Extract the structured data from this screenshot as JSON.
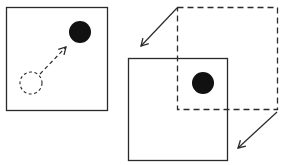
{
  "diagram": {
    "colors": {
      "stroke": "#2a2a2a",
      "fill": "#111111",
      "background": "#ffffff"
    },
    "left_panel": {
      "frame": {
        "x": 6,
        "y": 7,
        "w": 101,
        "h": 103
      },
      "start_circle": {
        "cx": 31,
        "cy": 83,
        "r": 11,
        "style": "dashed"
      },
      "end_dot": {
        "cx": 80,
        "cy": 32,
        "r": 11,
        "style": "filled"
      },
      "arrow": {
        "x1": 40,
        "y1": 74,
        "x2": 66,
        "y2": 47,
        "style": "dashed"
      }
    },
    "right_panel": {
      "solid_frame": {
        "x": 128,
        "y": 58,
        "w": 99,
        "h": 102
      },
      "dashed_frame": {
        "x": 177,
        "y": 7,
        "w": 100,
        "h": 102
      },
      "dot": {
        "cx": 203,
        "cy": 83,
        "r": 11,
        "style": "filled"
      },
      "arrows": [
        {
          "x1": 177,
          "y1": 8,
          "x2": 141,
          "y2": 46,
          "style": "solid"
        },
        {
          "x1": 277,
          "y1": 112,
          "x2": 238,
          "y2": 148,
          "style": "solid"
        }
      ]
    }
  }
}
